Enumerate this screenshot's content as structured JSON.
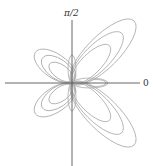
{
  "diagram": {
    "type": "polar-curves",
    "labels": {
      "theta_pi_over_2": "π/2",
      "theta_zero": "0"
    },
    "colors": {
      "curve": "#a8a8a8",
      "axis": "#555555",
      "background": "#ffffff"
    }
  }
}
